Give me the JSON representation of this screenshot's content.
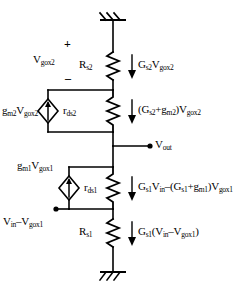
{
  "diagram": {
    "ink_color": "#000000",
    "background_color": "#ffffff"
  },
  "nodes": {
    "ground_top": "ground-symbol-top",
    "ground_bottom": "ground-symbol-bottom",
    "vout_terminal": "V",
    "vout_sub": "out",
    "vin_terminal": "V",
    "vin_sub": "in"
  },
  "components": [
    {
      "id": "resistor-rs2",
      "type": "resistor",
      "label_main": "R",
      "label_sub": "s2"
    },
    {
      "id": "resistor-rds2",
      "type": "resistor",
      "label_main": "r",
      "label_sub": "ds2"
    },
    {
      "id": "source-gm2",
      "type": "dependent-current-source",
      "label_main": "g",
      "label_sub": "m2",
      "label_rest": "V",
      "label_rest_sub": "gox2"
    },
    {
      "id": "resistor-rds1",
      "type": "resistor",
      "label_main": "r",
      "label_sub": "ds1"
    },
    {
      "id": "source-gm1",
      "type": "dependent-current-source",
      "label_main": "g",
      "label_sub": "m1",
      "label_rest": "V",
      "label_rest_sub": "gox1"
    },
    {
      "id": "resistor-rs1",
      "type": "resistor",
      "label_main": "R",
      "label_sub": "s1"
    }
  ],
  "labels": {
    "vgox2_polarity_plus": "+",
    "vgox2_polarity_minus": "–",
    "vgox2_main": "V",
    "vgox2_sub": "gox2",
    "rs2_main": "R",
    "rs2_sub": "s2",
    "rds2_main": "r",
    "rds2_sub": "ds2",
    "gm2_vgox2": "g_m2 V_gox2",
    "rds1_main": "r",
    "rds1_sub": "ds1",
    "gm1_vgox1": "g_m1 V_gox1",
    "rs1_main": "R",
    "rs1_sub": "s1",
    "vout": "V_out",
    "vin_minus_vgox1": "V_in – V_gox1"
  },
  "currents": [
    {
      "id": "current-rs2",
      "text": "G_s2 V_gox2",
      "direction": "down"
    },
    {
      "id": "current-rds2",
      "text": "(G_s2+g_m2)V_gox2",
      "direction": "down"
    },
    {
      "id": "current-rds1",
      "text": "G_s1 V_in – (G_s1+g_m1)V_gox1",
      "direction": "down"
    },
    {
      "id": "current-rs1",
      "text": "G_s1(V_in – V_gox1)",
      "direction": "down"
    }
  ]
}
